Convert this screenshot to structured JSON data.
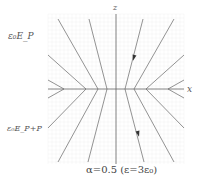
{
  "diagram": {
    "labels": {
      "upper_region": "ε₀E_P",
      "lower_region": "ε₀E_P+P",
      "z_axis": "z",
      "x_axis": "x",
      "caption": "α=0.5 (ε=3ε₀)"
    },
    "colors": {
      "line": "#777777",
      "arrow": "#333333",
      "text": "#555555"
    },
    "axes": {
      "origin": [
        116,
        89
      ],
      "z_axis": {
        "x": 116,
        "y1": 14,
        "y2": 164
      },
      "x_axis": {
        "y": 89,
        "x1": 48,
        "x2": 184
      }
    },
    "upper_lines": [
      {
        "from": [
          58,
          19
        ],
        "to": [
          98,
          89
        ]
      },
      {
        "from": [
          89,
          19
        ],
        "to": [
          107,
          89
        ]
      },
      {
        "from": [
          143,
          19
        ],
        "to": [
          125,
          89
        ]
      },
      {
        "from": [
          174,
          19
        ],
        "to": [
          134,
          89
        ]
      },
      {
        "from": [
          48,
          55
        ],
        "to": [
          86,
          89
        ]
      },
      {
        "from": [
          184,
          55
        ],
        "to": [
          146,
          89
        ]
      },
      {
        "from": [
          48,
          80
        ],
        "to": [
          64,
          89
        ]
      },
      {
        "from": [
          184,
          80
        ],
        "to": [
          168,
          89
        ]
      }
    ],
    "lower_lines": [
      {
        "from": [
          98,
          89
        ],
        "to": [
          58,
          162
        ]
      },
      {
        "from": [
          107,
          89
        ],
        "to": [
          88,
          162
        ]
      },
      {
        "from": [
          125,
          89
        ],
        "to": [
          144,
          162
        ]
      },
      {
        "from": [
          134,
          89
        ],
        "to": [
          174,
          162
        ]
      },
      {
        "from": [
          86,
          89
        ],
        "to": [
          48,
          128
        ]
      },
      {
        "from": [
          146,
          89
        ],
        "to": [
          184,
          128
        ]
      },
      {
        "from": [
          64,
          89
        ],
        "to": [
          48,
          98
        ]
      },
      {
        "from": [
          168,
          89
        ],
        "to": [
          184,
          98
        ]
      }
    ],
    "arrows": [
      {
        "at": [
          134,
          57
        ],
        "direction": "down-left-along-line"
      },
      {
        "at": [
          138,
          133
        ],
        "direction": "down-right-along-line"
      }
    ]
  }
}
